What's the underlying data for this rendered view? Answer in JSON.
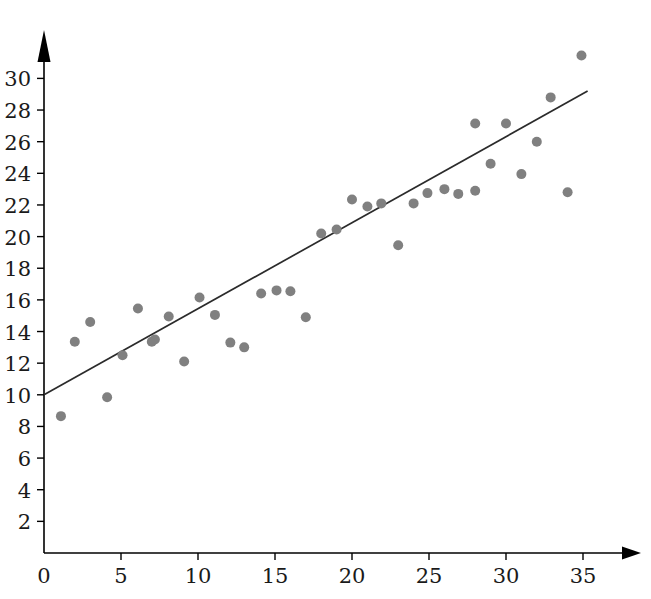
{
  "chart_data": {
    "type": "scatter",
    "title": "",
    "subtitle": "",
    "xlabel": "",
    "ylabel": "",
    "xlim": [
      0,
      37.5
    ],
    "ylim": [
      0,
      33
    ],
    "grid": false,
    "legend": null,
    "x_ticks": [
      0,
      5,
      10,
      15,
      20,
      25,
      30,
      35
    ],
    "y_ticks": [
      2,
      4,
      6,
      8,
      10,
      12,
      14,
      16,
      18,
      20,
      22,
      24,
      26,
      28,
      30
    ],
    "x_tick_labels": [
      "0",
      "5",
      "10",
      "15",
      "20",
      "25",
      "30",
      "35"
    ],
    "y_tick_labels": [
      "2",
      "4",
      "6",
      "8",
      "10",
      "12",
      "14",
      "16",
      "18",
      "20",
      "22",
      "24",
      "26",
      "28",
      "30"
    ],
    "point_color": "#808080",
    "line_color": "#2b2b2b",
    "axis_color": "#000000",
    "point_radius": 5,
    "x": [
      1.1,
      2.0,
      3.0,
      4.1,
      5.1,
      6.1,
      7.0,
      7.2,
      8.1,
      9.1,
      10.1,
      11.1,
      12.1,
      13.0,
      14.1,
      15.1,
      16.0,
      17.0,
      18.0,
      19.0,
      20.0,
      21.0,
      21.9,
      23.0,
      24.0,
      24.9,
      26.0,
      26.9,
      28.0,
      28.0,
      29.0,
      30.0,
      31.0,
      32.0,
      32.9,
      34.0,
      34.9
    ],
    "y": [
      8.65,
      13.35,
      14.6,
      9.85,
      12.5,
      15.45,
      13.35,
      13.5,
      14.95,
      12.1,
      16.15,
      15.05,
      13.3,
      13.0,
      16.4,
      16.6,
      16.55,
      14.9,
      20.2,
      20.45,
      22.35,
      21.9,
      22.1,
      19.45,
      22.1,
      22.75,
      23.0,
      22.7,
      27.15,
      22.9,
      24.6,
      27.15,
      23.95,
      26.0,
      28.8,
      22.8,
      31.45
    ],
    "trend_line": {
      "type": "linear-fit",
      "intercept": 10.0,
      "slope": 0.545,
      "x_start": 0,
      "x_end": 35.3,
      "y_start": 10.0,
      "y_end": 29.2
    },
    "points": [
      {
        "x": 1.1,
        "y": 8.65
      },
      {
        "x": 2.0,
        "y": 13.35
      },
      {
        "x": 3.0,
        "y": 14.6
      },
      {
        "x": 4.1,
        "y": 9.85
      },
      {
        "x": 5.1,
        "y": 12.5
      },
      {
        "x": 6.1,
        "y": 15.45
      },
      {
        "x": 7.0,
        "y": 13.35
      },
      {
        "x": 7.2,
        "y": 13.5
      },
      {
        "x": 8.1,
        "y": 14.95
      },
      {
        "x": 9.1,
        "y": 12.1
      },
      {
        "x": 10.1,
        "y": 16.15
      },
      {
        "x": 11.1,
        "y": 15.05
      },
      {
        "x": 12.1,
        "y": 13.3
      },
      {
        "x": 13.0,
        "y": 13.0
      },
      {
        "x": 14.1,
        "y": 16.4
      },
      {
        "x": 15.1,
        "y": 16.6
      },
      {
        "x": 16.0,
        "y": 16.55
      },
      {
        "x": 17.0,
        "y": 14.9
      },
      {
        "x": 18.0,
        "y": 20.2
      },
      {
        "x": 19.0,
        "y": 20.45
      },
      {
        "x": 20.0,
        "y": 22.35
      },
      {
        "x": 21.0,
        "y": 21.9
      },
      {
        "x": 21.9,
        "y": 22.1
      },
      {
        "x": 23.0,
        "y": 19.45
      },
      {
        "x": 24.0,
        "y": 22.1
      },
      {
        "x": 24.9,
        "y": 22.75
      },
      {
        "x": 26.0,
        "y": 23.0
      },
      {
        "x": 26.9,
        "y": 22.7
      },
      {
        "x": 28.0,
        "y": 27.15
      },
      {
        "x": 28.0,
        "y": 22.9
      },
      {
        "x": 29.0,
        "y": 24.6
      },
      {
        "x": 30.0,
        "y": 27.15
      },
      {
        "x": 31.0,
        "y": 23.95
      },
      {
        "x": 32.0,
        "y": 26.0
      },
      {
        "x": 32.9,
        "y": 28.8
      },
      {
        "x": 34.0,
        "y": 22.8
      },
      {
        "x": 34.9,
        "y": 31.45
      }
    ]
  },
  "axes": {
    "x_axis_name": "horizontal-axis",
    "y_axis_name": "vertical-axis",
    "x_arrow": "arrow-right",
    "y_arrow": "arrow-up"
  }
}
